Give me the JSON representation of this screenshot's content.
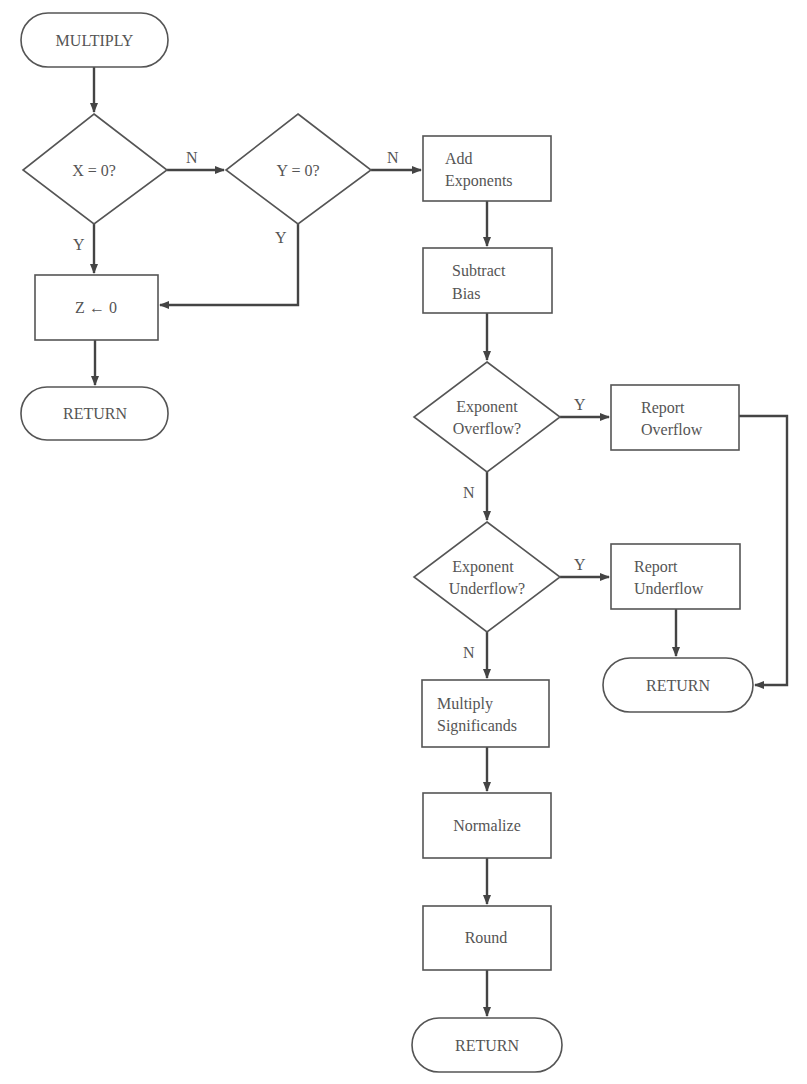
{
  "nodes": {
    "start": {
      "label": "MULTIPLY"
    },
    "x_zero": {
      "label": "X = 0?"
    },
    "y_zero": {
      "label": "Y = 0?"
    },
    "z_zero": {
      "label": "Z ← 0"
    },
    "return1": {
      "label": "RETURN"
    },
    "add_exp": {
      "line1": "Add",
      "line2": "Exponents"
    },
    "sub_bias": {
      "line1": "Subtract",
      "line2": "Bias"
    },
    "exp_overflow": {
      "line1": "Exponent",
      "line2": "Overflow?"
    },
    "report_overflow": {
      "line1": "Report",
      "line2": "Overflow"
    },
    "exp_underflow": {
      "line1": "Exponent",
      "line2": "Underflow?"
    },
    "report_underflow": {
      "line1": "Report",
      "line2": "Underflow"
    },
    "return2": {
      "label": "RETURN"
    },
    "mult_sig": {
      "line1": "Multiply",
      "line2": "Significands"
    },
    "normalize": {
      "label": "Normalize"
    },
    "round": {
      "label": "Round"
    },
    "return3": {
      "label": "RETURN"
    }
  },
  "edge_labels": {
    "x_no": "N",
    "x_yes": "Y",
    "y_no": "N",
    "y_yes": "Y",
    "overflow_yes": "Y",
    "overflow_no": "N",
    "underflow_yes": "Y",
    "underflow_no": "N"
  }
}
